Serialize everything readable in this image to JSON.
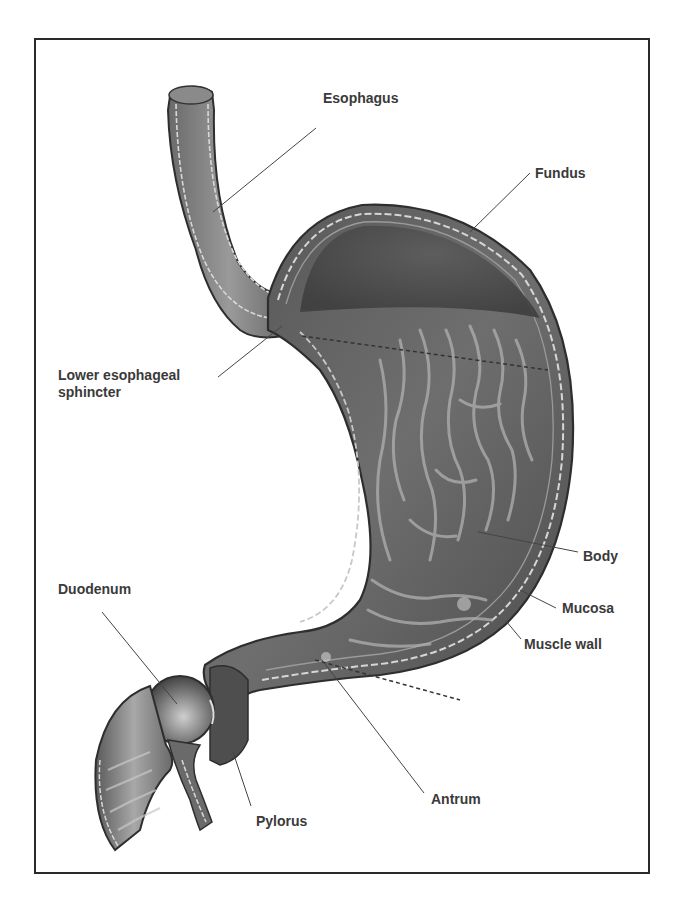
{
  "figure": {
    "labels": {
      "esophagus": "Esophagus",
      "fundus": "Fundus",
      "lower_esophageal_sphincter_line1": "Lower esophageal",
      "lower_esophageal_sphincter_line2": "sphincter",
      "body": "Body",
      "mucosa": "Mucosa",
      "muscle_wall": "Muscle wall",
      "duodenum": "Duodenum",
      "pylorus": "Pylorus",
      "antrum": "Antrum"
    },
    "colors": {
      "frame": "#2a2a2a",
      "label_text": "#3a3a3a",
      "tissue_dark": "#4a4a4a",
      "tissue_mid": "#7a7a7a",
      "tissue_light": "#b8b8b8",
      "wall_highlight": "#d8d8d8",
      "leader_line": "#444444"
    }
  }
}
